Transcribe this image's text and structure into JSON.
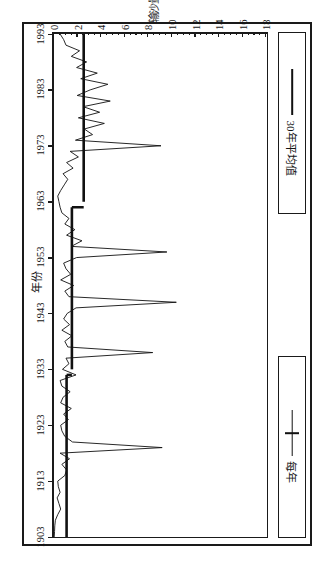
{
  "figure": {
    "frame": true,
    "rotation_deg": 90,
    "background": "#ffffff",
    "ink_color": "#1a1a1a"
  },
  "legend": {
    "position": "top",
    "entries": [
      {
        "key": "avg30",
        "label": "30年平均值",
        "marker": "thick-line",
        "color": "#111111"
      },
      {
        "key": "annual",
        "label": "每年",
        "marker": "line-with-tick",
        "color": "#111111"
      }
    ]
  },
  "chart_data": {
    "type": "line",
    "title": "",
    "subtitle": "",
    "xlabel": "年份",
    "ylabel": "输沙量/10⁴t",
    "xlim": [
      1903,
      1993
    ],
    "ylim": [
      0,
      18
    ],
    "xticks": [
      1903,
      1913,
      1923,
      1933,
      1943,
      1953,
      1963,
      1973,
      1983,
      1993
    ],
    "yticks": [
      0,
      2,
      4,
      6,
      8,
      10,
      12,
      14,
      16,
      18
    ],
    "y_minor_step": 0.5,
    "grid": false,
    "legend_position": "top",
    "series": [
      {
        "name": "每年",
        "style": "thin-line",
        "color": "#111111",
        "x": [
          1903,
          1904,
          1905,
          1906,
          1907,
          1908,
          1909,
          1910,
          1911,
          1912,
          1913,
          1914,
          1915,
          1916,
          1917,
          1918,
          1919,
          1920,
          1921,
          1922,
          1923,
          1924,
          1925,
          1926,
          1927,
          1928,
          1929,
          1930,
          1931,
          1932,
          1933,
          1934,
          1935,
          1936,
          1937,
          1938,
          1939,
          1940,
          1941,
          1942,
          1943,
          1944,
          1945,
          1946,
          1947,
          1948,
          1949,
          1950,
          1951,
          1952,
          1953,
          1954,
          1955,
          1956,
          1957,
          1958,
          1959,
          1960,
          1961,
          1962,
          1963,
          1964,
          1965,
          1966,
          1967,
          1968,
          1969,
          1970,
          1971,
          1972,
          1973,
          1974,
          1975,
          1976,
          1977,
          1978,
          1979,
          1980,
          1981,
          1982,
          1983,
          1984,
          1985,
          1986,
          1987,
          1988,
          1989,
          1990,
          1991,
          1992,
          1993
        ],
        "values": [
          0.05,
          0.08,
          0.1,
          0.15,
          0.35,
          0.6,
          0.45,
          0.3,
          0.55,
          0.4,
          0.35,
          0.95,
          1.1,
          0.7,
          1.35,
          0.55,
          9.2,
          1.6,
          0.95,
          0.7,
          0.6,
          1.25,
          0.85,
          1.5,
          0.6,
          0.8,
          1.4,
          0.7,
          0.55,
          1.9,
          0.75,
          1.3,
          1.05,
          8.4,
          1.2,
          0.95,
          1.55,
          0.7,
          1.35,
          0.85,
          1.15,
          1.9,
          10.4,
          1.3,
          0.95,
          1.7,
          0.6,
          1.45,
          1.05,
          0.85,
          1.95,
          9.6,
          1.5,
          2.4,
          1.1,
          1.8,
          0.95,
          1.3,
          0.7,
          0.55,
          0.45,
          0.35,
          0.6,
          0.9,
          1.2,
          0.8,
          1.65,
          1.1,
          2.1,
          1.4,
          9.1,
          1.85,
          3.3,
          2.6,
          4.3,
          2.1,
          3.9,
          2.5,
          4.8,
          2.0,
          3.1,
          4.6,
          2.3,
          3.7,
          1.95,
          2.8,
          1.5,
          2.2,
          1.05,
          0.85,
          0.55
        ]
      },
      {
        "name": "30年平均值",
        "style": "thick-step-line",
        "color": "#111111",
        "segments": [
          {
            "start": 1903,
            "end": 1932,
            "value": 1.1
          },
          {
            "start": 1933,
            "end": 1962,
            "value": 1.55
          },
          {
            "start": 1963,
            "end": 1993,
            "value": 2.55
          }
        ]
      }
    ]
  }
}
